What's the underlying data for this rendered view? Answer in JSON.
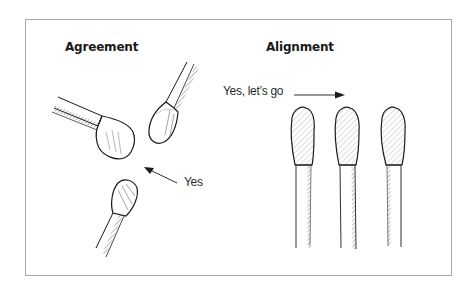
{
  "figure": {
    "panels": [
      {
        "title": "Agreement",
        "annotation": "Yes",
        "matches": 3,
        "arrangement": "heads converging toward a center point"
      },
      {
        "title": "Alignment",
        "annotation": "Yes, let’s go",
        "matches": 3,
        "arrangement": "heads aligned upward in parallel"
      }
    ],
    "colors": {
      "ink": "#1a1a1a",
      "frame": "#a8a8a8",
      "background": "#ffffff"
    },
    "icons": [
      "match-icon",
      "arrow-icon"
    ]
  }
}
